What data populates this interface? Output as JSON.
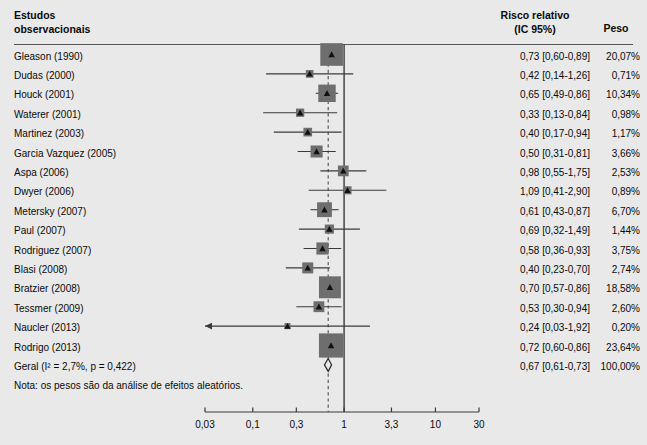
{
  "figure": {
    "background_color": "#e9e9e9",
    "marker_color": "#6e6e6e",
    "line_color": "#3a3a3a"
  },
  "header": {
    "left_line1": "Estudos",
    "left_line2": "observacionais",
    "rr_line1": "Risco relativo",
    "rr_line2": "(IC 95%)",
    "weight": "Peso"
  },
  "note": "Nota: os pesos são da análise de efeitos aleatórios.",
  "chart_data": {
    "type": "forest",
    "title": "Estudos observacionais",
    "xlabel": "",
    "effect_measure": "Risco relativo (IC 95%)",
    "xscale": "log",
    "xlim": [
      0.03,
      30
    ],
    "xticks": [
      0.03,
      0.1,
      0.3,
      1,
      3.3,
      10,
      30
    ],
    "xtick_labels": [
      "0,03",
      "0,1",
      "0,3",
      "1",
      "3,3",
      "10",
      "30"
    ],
    "null_line": 1,
    "pooled_line": 0.67,
    "grid": false,
    "legend": "none",
    "studies": [
      {
        "label": "Gleason (1990)",
        "rr": 0.73,
        "lo": 0.6,
        "hi": 0.89,
        "rr_text": "0,73 [0,60-0,89]",
        "weight": 20.07,
        "weight_text": "20,07%",
        "arrow_left": false
      },
      {
        "label": "Dudas (2000)",
        "rr": 0.42,
        "lo": 0.14,
        "hi": 1.26,
        "rr_text": "0,42 [0,14-1,26]",
        "weight": 0.71,
        "weight_text": "0,71%",
        "arrow_left": false
      },
      {
        "label": "Houck (2001)",
        "rr": 0.65,
        "lo": 0.49,
        "hi": 0.86,
        "rr_text": "0,65 [0,49-0,86]",
        "weight": 10.34,
        "weight_text": "10,34%",
        "arrow_left": false
      },
      {
        "label": "Waterer (2001)",
        "rr": 0.33,
        "lo": 0.13,
        "hi": 0.84,
        "rr_text": "0,33 [0,13-0,84]",
        "weight": 0.98,
        "weight_text": "0,98%",
        "arrow_left": false
      },
      {
        "label": "Martinez (2003)",
        "rr": 0.4,
        "lo": 0.17,
        "hi": 0.94,
        "rr_text": "0,40 [0,17-0,94]",
        "weight": 1.17,
        "weight_text": "1,17%",
        "arrow_left": false
      },
      {
        "label": "Garcia Vazquez (2005)",
        "rr": 0.5,
        "lo": 0.31,
        "hi": 0.81,
        "rr_text": "0,50 [0,31-0,81]",
        "weight": 3.66,
        "weight_text": "3,66%",
        "arrow_left": false
      },
      {
        "label": "Aspa (2006)",
        "rr": 0.98,
        "lo": 0.55,
        "hi": 1.75,
        "rr_text": "0,98 [0,55-1,75]",
        "weight": 2.53,
        "weight_text": "2,53%",
        "arrow_left": false
      },
      {
        "label": "Dwyer (2006)",
        "rr": 1.09,
        "lo": 0.41,
        "hi": 2.9,
        "rr_text": "1,09 [0,41-2,90]",
        "weight": 0.89,
        "weight_text": "0,89%",
        "arrow_left": false
      },
      {
        "label": "Metersky (2007)",
        "rr": 0.61,
        "lo": 0.43,
        "hi": 0.87,
        "rr_text": "0,61 [0,43-0,87]",
        "weight": 6.7,
        "weight_text": "6,70%",
        "arrow_left": false
      },
      {
        "label": "Paul (2007)",
        "rr": 0.69,
        "lo": 0.32,
        "hi": 1.49,
        "rr_text": "0,69 [0,32-1,49]",
        "weight": 1.44,
        "weight_text": "1,44%",
        "arrow_left": false
      },
      {
        "label": "Rodriguez (2007)",
        "rr": 0.58,
        "lo": 0.36,
        "hi": 0.93,
        "rr_text": "0,58 [0,36-0,93]",
        "weight": 3.75,
        "weight_text": "3,75%",
        "arrow_left": false
      },
      {
        "label": "Blasi (2008)",
        "rr": 0.4,
        "lo": 0.23,
        "hi": 0.7,
        "rr_text": "0,40 [0,23-0,70]",
        "weight": 2.74,
        "weight_text": "2,74%",
        "arrow_left": false
      },
      {
        "label": "Bratzier (2008)",
        "rr": 0.7,
        "lo": 0.57,
        "hi": 0.86,
        "rr_text": "0,70 [0,57-0,86]",
        "weight": 18.58,
        "weight_text": "18,58%",
        "arrow_left": false
      },
      {
        "label": "Tessmer (2009)",
        "rr": 0.53,
        "lo": 0.3,
        "hi": 0.94,
        "rr_text": "0,53 [0,30-0,94]",
        "weight": 2.6,
        "weight_text": "2,60%",
        "arrow_left": false
      },
      {
        "label": "Naucler (2013)",
        "rr": 0.24,
        "lo": 0.03,
        "hi": 1.92,
        "rr_text": "0,24 [0,03-1,92]",
        "weight": 0.2,
        "weight_text": "0,20%",
        "arrow_left": true
      },
      {
        "label": "Rodrigo (2013)",
        "rr": 0.72,
        "lo": 0.6,
        "hi": 0.86,
        "rr_text": "0,72 [0,60-0,86]",
        "weight": 23.64,
        "weight_text": "23,64%",
        "arrow_left": false
      }
    ],
    "pooled": {
      "label": "Geral (I² = 2,7%, p = 0,422)",
      "rr": 0.67,
      "lo": 0.61,
      "hi": 0.73,
      "rr_text": "0,67 [0,61-0,73]",
      "weight_text": "100,00%",
      "heterogeneity_i2": "2,7%",
      "heterogeneity_p": "0,422"
    }
  }
}
